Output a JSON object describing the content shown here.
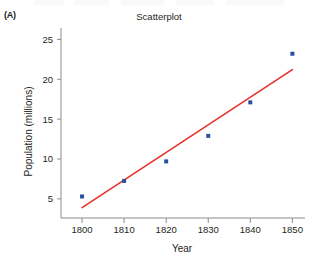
{
  "panel": {
    "label": "(A)"
  },
  "chart_data": {
    "type": "scatter",
    "title": "Scatterplot",
    "xlabel": "Year",
    "ylabel": "Population (millions)",
    "x": [
      1800,
      1810,
      1820,
      1830,
      1840,
      1850
    ],
    "values": [
      5.3,
      7.25,
      9.7,
      12.9,
      17.1,
      23.2
    ],
    "series": [
      {
        "name": "Population",
        "type": "scatter",
        "marker_color": "#2b4fa0",
        "points": [
          {
            "x": 1800,
            "y": 5.3
          },
          {
            "x": 1810,
            "y": 7.25
          },
          {
            "x": 1820,
            "y": 9.7
          },
          {
            "x": 1830,
            "y": 12.9
          },
          {
            "x": 1840,
            "y": 17.1
          },
          {
            "x": 1850,
            "y": 23.2
          }
        ]
      },
      {
        "name": "Regression line",
        "type": "line",
        "line_color": "#e8312a",
        "endpoints": [
          {
            "x": 1800,
            "y": 3.9
          },
          {
            "x": 1850,
            "y": 21.2
          }
        ]
      }
    ],
    "xlim": [
      1795,
      1853
    ],
    "ylim": [
      2.6,
      25.8
    ],
    "xticks": [
      1800,
      1810,
      1820,
      1830,
      1840,
      1850
    ],
    "xtick_labels": [
      "1800",
      "1810",
      "1820",
      "1830",
      "1840",
      "1850"
    ],
    "yticks": [
      5,
      10,
      15,
      20,
      25
    ],
    "ytick_labels": [
      "5",
      "10",
      "15",
      "20",
      "25"
    ],
    "grid": false,
    "legend": "none",
    "axis_color": "#8c8c8c"
  }
}
